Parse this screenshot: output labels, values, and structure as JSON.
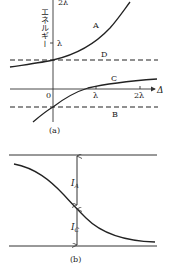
{
  "panel_a": {
    "y_axis_label": "エネルギー",
    "y_top_tick": "2λ",
    "y_tick": "λ",
    "x_axis_label": "Δ",
    "origin": "0",
    "x_ticks": [
      "λ",
      "2λ"
    ],
    "curves": {
      "A": "A",
      "B": "B",
      "C": "C",
      "D": "D"
    },
    "caption": "(a)"
  },
  "panel_b": {
    "label_IA_main": "I",
    "label_IA_sub": "A",
    "label_IC_main": "I",
    "label_IC_sub": "C",
    "caption": "(b)"
  }
}
